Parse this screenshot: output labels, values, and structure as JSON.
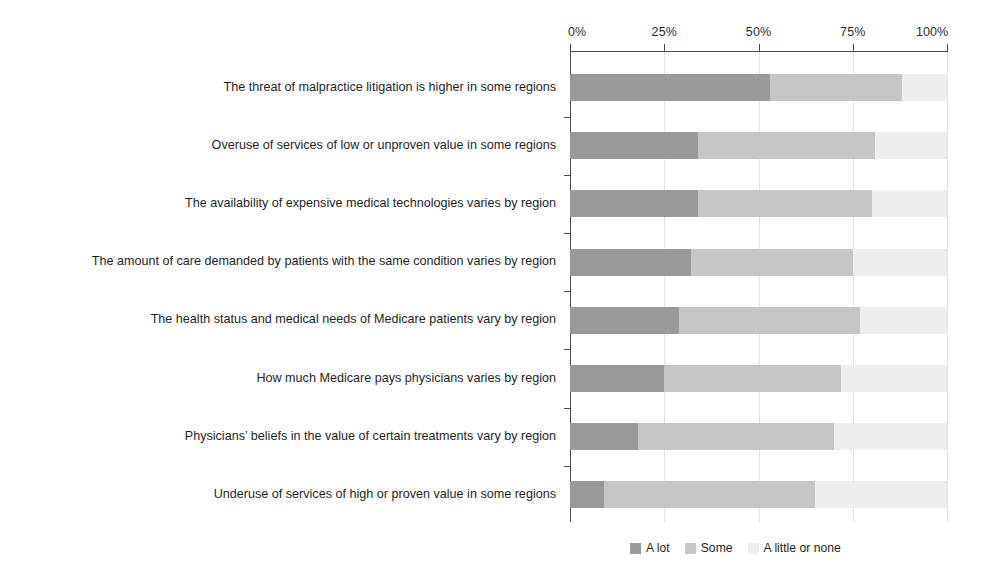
{
  "chart_data": {
    "type": "bar",
    "orientation": "horizontal",
    "stacked": true,
    "stack_mode": "percent",
    "title": "",
    "subtitle": "",
    "xlabel": "",
    "ylabel": "",
    "xlim": [
      0,
      100
    ],
    "xticks": [
      0,
      25,
      50,
      75,
      100
    ],
    "xtick_labels": [
      "0%",
      "25%",
      "50%",
      "75%",
      "100%"
    ],
    "grid": true,
    "legend_position": "bottom-right",
    "categories": [
      "The threat of malpractice litigation is higher in some regions",
      "Overuse of services of low or unproven value in some regions",
      "The availability of expensive medical technologies varies by region",
      "The amount of care demanded by patients with the same condition varies by region",
      "The health status and medical needs of Medicare patients vary by region",
      "How much Medicare pays physicians varies by region",
      "Physicians’ beliefs in the value of certain treatments vary by region",
      "Underuse of services of high or proven value in some regions"
    ],
    "series": [
      {
        "name": "A lot",
        "color": "#999999",
        "values": [
          53,
          34,
          34,
          32,
          29,
          25,
          18,
          9
        ]
      },
      {
        "name": "Some",
        "color": "#c6c6c6",
        "values": [
          35,
          47,
          46,
          43,
          48,
          47,
          52,
          56
        ]
      },
      {
        "name": "A little or none",
        "color": "#eeeeee",
        "values": [
          12,
          19,
          20,
          25,
          23,
          28,
          30,
          35
        ]
      }
    ]
  },
  "legend": {
    "items": [
      {
        "label": "A lot",
        "color": "#999999"
      },
      {
        "label": "Some",
        "color": "#c6c6c6"
      },
      {
        "label": "A little or none",
        "color": "#eeeeee"
      }
    ]
  },
  "axis": {
    "tick_labels": [
      "0%",
      "25%",
      "50%",
      "75%",
      "100%"
    ]
  }
}
